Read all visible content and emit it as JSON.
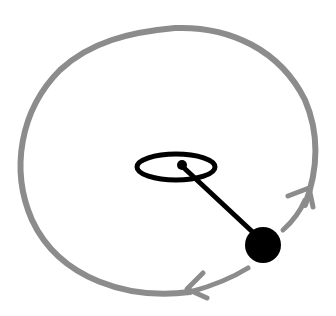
{
  "diagram": {
    "colors": {
      "background": "#ffffff",
      "orbit": "#8c8c8c",
      "ink": "#000000"
    },
    "orbit_path": {
      "label": "",
      "direction": "clockwise-arrows"
    },
    "pivot": {
      "label": ""
    },
    "rod": {
      "label": ""
    },
    "bob": {
      "label": ""
    }
  }
}
